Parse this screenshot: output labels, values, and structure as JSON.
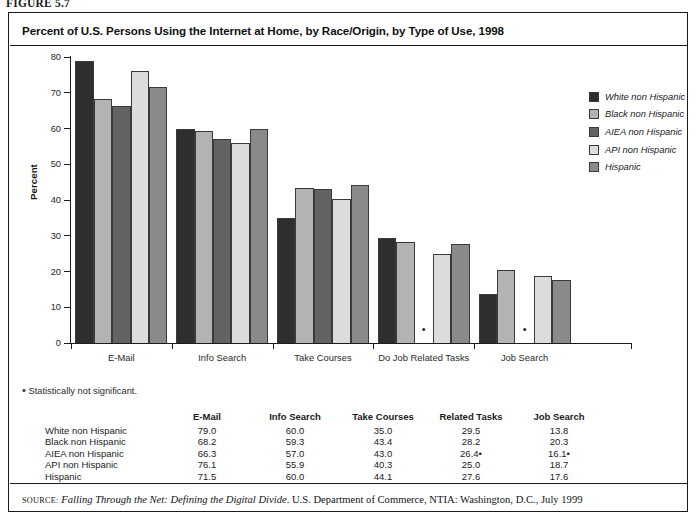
{
  "figure_label": "FIGURE 5.7",
  "title": "Percent of U.S. Persons Using the Internet at Home, by Race/Origin, by Type of Use, 1998",
  "footnote": {
    "marker": "•",
    "text": "Statistically not significant."
  },
  "source": {
    "prefix": "SOURCE",
    "colon": ":",
    "italic_part": "Falling Through the Net: Defining the Digital Divide",
    "rest": ". U.S. Department of Commerce, NTIA: Washington, D.C., July 1999"
  },
  "axes": {
    "ylabel": "Percent",
    "yticks": [
      "80",
      "70",
      "60",
      "50",
      "40",
      "30",
      "20",
      "10",
      "0"
    ],
    "ymin": 0,
    "ymax": 80
  },
  "legend": {
    "items": [
      {
        "label": "White non Hispanic",
        "color": "#2e2e2e"
      },
      {
        "label": "Black non Hispanic",
        "color": "#b3b3b3"
      },
      {
        "label": "AIEA non Hispanic",
        "color": "#636363"
      },
      {
        "label": "API non Hispanic",
        "color": "#dcdcdc"
      },
      {
        "label": "Hispanic",
        "color": "#8a8a8a"
      }
    ]
  },
  "chart_data": {
    "type": "bar",
    "title": "Percent of U.S. Persons Using the Internet at Home, by Race/Origin, by Type of Use, 1998",
    "xlabel": "",
    "ylabel": "Percent",
    "ylim": [
      0,
      80
    ],
    "ytick_step": 10,
    "grid": false,
    "legend_position": "right",
    "categories": [
      "E-Mail",
      "Info Search",
      "Take Courses",
      "Do Job Related Tasks",
      "Job Search"
    ],
    "series": [
      {
        "name": "White non Hispanic",
        "color": "#2e2e2e",
        "values": [
          79.0,
          60.0,
          35.0,
          29.5,
          13.8
        ],
        "not_significant": [
          false,
          false,
          false,
          false,
          false
        ]
      },
      {
        "name": "Black non Hispanic",
        "color": "#b3b3b3",
        "values": [
          68.2,
          59.3,
          43.4,
          28.2,
          20.3
        ],
        "not_significant": [
          false,
          false,
          false,
          false,
          false
        ]
      },
      {
        "name": "AIEA non Hispanic",
        "color": "#636363",
        "values": [
          66.3,
          57.0,
          43.0,
          26.4,
          16.1
        ],
        "not_significant": [
          false,
          false,
          false,
          true,
          true
        ]
      },
      {
        "name": "API non Hispanic",
        "color": "#dcdcdc",
        "values": [
          76.1,
          55.9,
          40.3,
          25.0,
          18.7
        ],
        "not_significant": [
          false,
          false,
          false,
          false,
          false
        ]
      },
      {
        "name": "Hispanic",
        "color": "#8a8a8a",
        "values": [
          71.5,
          60.0,
          44.1,
          27.6,
          17.6
        ],
        "not_significant": [
          false,
          false,
          false,
          false,
          false
        ]
      }
    ]
  },
  "table": {
    "row_header_blank": "",
    "columns": [
      "E-Mail",
      "Info Search",
      "Take Courses",
      "Related Tasks",
      "Job Search"
    ],
    "rows": [
      {
        "label": "White non Hispanic",
        "values": [
          "79.0",
          "60.0",
          "35.0",
          "29.5",
          "13.8"
        ]
      },
      {
        "label": "Black non Hispanic",
        "values": [
          "68.2",
          "59.3",
          "43.4",
          "28.2",
          "20.3"
        ]
      },
      {
        "label": "AIEA non Hispanic",
        "values": [
          "66.3",
          "57.0",
          "43.0",
          "26.4•",
          "16.1•"
        ]
      },
      {
        "label": "API non Hispanic",
        "values": [
          "76.1",
          "55.9",
          "40.3",
          "25.0",
          "18.7"
        ]
      },
      {
        "label": "Hispanic",
        "values": [
          "71.5",
          "60.0",
          "44.1",
          "27.6",
          "17.6"
        ]
      }
    ]
  }
}
